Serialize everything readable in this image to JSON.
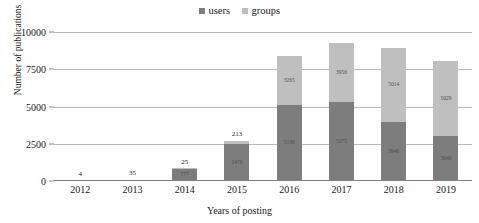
{
  "chart_data": {
    "type": "bar",
    "subtype": "stacked-column",
    "title": "",
    "xlabel": "Years of posting",
    "ylabel": "Number of publications",
    "categories": [
      "2012",
      "2013",
      "2014",
      "2015",
      "2016",
      "2017",
      "2018",
      "2019"
    ],
    "series": [
      {
        "name": "users",
        "color": "#7d7d7d",
        "values": [
          4,
          35,
          777,
          2476,
          5130,
          5275,
          3946,
          3040
        ],
        "labels": [
          "",
          "",
          "777",
          "2476",
          "5130",
          "5275",
          "3946",
          "3040"
        ]
      },
      {
        "name": "groups",
        "color": "#bfbfbf",
        "values": [
          0,
          0,
          25,
          213,
          3265,
          3956,
          5014,
          5029
        ],
        "labels": [
          "",
          "",
          "",
          "",
          "3265",
          "3956",
          "5014",
          "5029"
        ]
      }
    ],
    "totals": [
      4,
      35,
      802,
      2689,
      8395,
      9231,
      8960,
      8069
    ],
    "total_labels": [
      "4",
      "35",
      "25",
      "213",
      "",
      "",
      "",
      ""
    ],
    "ylim": [
      0,
      10000
    ],
    "yticks": [
      0,
      2500,
      5000,
      7500,
      10000
    ],
    "ytick_labels": [
      "0",
      "2500",
      "5000",
      "7500",
      "10000"
    ],
    "grid": true,
    "legend_position": "top-center"
  },
  "legend": {
    "entries": [
      {
        "label": "users",
        "color": "#7d7d7d"
      },
      {
        "label": "groups",
        "color": "#bfbfbf"
      }
    ]
  },
  "axes": {
    "y_title": "Number of publications",
    "x_title": "Years of posting"
  }
}
